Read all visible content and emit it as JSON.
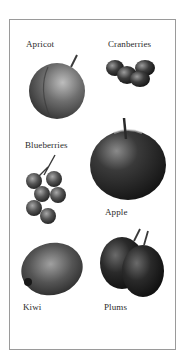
{
  "panel": {
    "items": [
      {
        "name": "Apricot",
        "label": "Apricot"
      },
      {
        "name": "Cranberries",
        "label": "Cranberries"
      },
      {
        "name": "Blueberries",
        "label": "Blueberries"
      },
      {
        "name": "Apple",
        "label": "Apple"
      },
      {
        "name": "Kiwi",
        "label": "Kiwi"
      },
      {
        "name": "Plums",
        "label": "Plums"
      }
    ]
  },
  "colors": {
    "border": "#9a9a9a",
    "text": "#2b2b2b",
    "fruit_dark": "#1c1c1c",
    "fruit_mid": "#5a5a5a",
    "fruit_light": "#9a9a9a"
  }
}
